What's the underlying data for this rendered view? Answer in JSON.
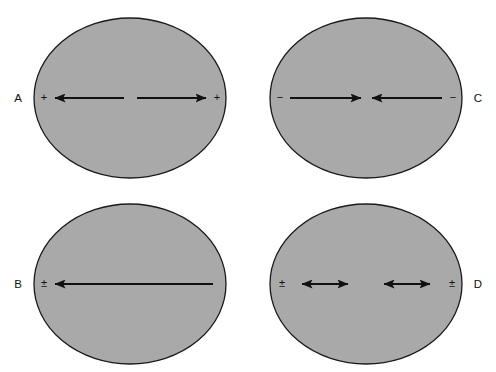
{
  "figure": {
    "background_color": "#ffffff",
    "ellipse_fill": "#a9a9a9",
    "ellipse_stroke": "#1a1a1a",
    "arrow_color": "#111111",
    "panels": [
      {
        "id": "A",
        "label": "A",
        "label_side": "left",
        "left_sign": "+",
        "right_sign": "+",
        "arrow_pattern": "outward-pair",
        "description": "two arrows pointing outward from center toward plus signs at both ends"
      },
      {
        "id": "C",
        "label": "C",
        "label_side": "right",
        "left_sign": "−",
        "right_sign": "−",
        "arrow_pattern": "inward-pair",
        "description": "two arrows pointing inward toward center from minus signs at both ends"
      },
      {
        "id": "B",
        "label": "B",
        "label_side": "left",
        "left_sign": "±",
        "right_sign": "",
        "arrow_pattern": "single-left",
        "description": "one long arrow spanning the ellipse pointing left toward the plus-minus sign"
      },
      {
        "id": "D",
        "label": "D",
        "label_side": "right",
        "left_sign": "±",
        "right_sign": "±",
        "arrow_pattern": "double-headed-pair",
        "description": "two double-headed arrows, plus-minus signs at both outer ends"
      }
    ]
  }
}
